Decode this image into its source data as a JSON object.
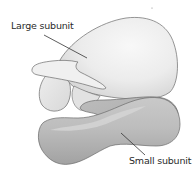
{
  "diagram": {
    "labels": {
      "large_subunit": "Large subunit",
      "small_subunit": "Small subunit"
    },
    "colors": {
      "large_subunit_fill": "#ececec",
      "large_subunit_shadow": "#d4d4d4",
      "small_subunit_fill": "#b9b9b9",
      "small_subunit_shadow": "#9c9c9c",
      "outline": "#6a6a6a",
      "leader_line": "#333333",
      "text": "#2a2a2a"
    }
  }
}
